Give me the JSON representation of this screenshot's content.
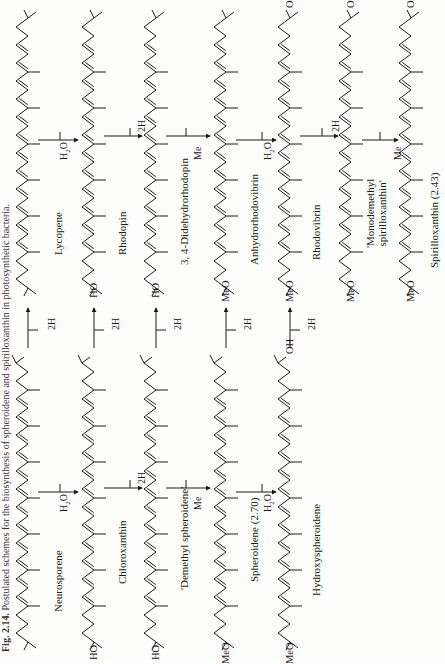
{
  "caption": {
    "figure_number": "Fig. 2.14.",
    "text": "Postulated schemes for the biosynthesis of spheroidene and spirilloxanthin in photosynthetic bacteria."
  },
  "left_column": {
    "title": "Spheroidene pathway",
    "compounds": [
      {
        "name": "Neurosporene",
        "end_group_left": "",
        "end_group_right": ""
      },
      {
        "name": "Chloroxanthin",
        "end_group_left": "HO",
        "end_group_right": ""
      },
      {
        "name": "'Demethyl spheroidene'",
        "end_group_left": "HO",
        "end_group_right": ""
      },
      {
        "name": "Spheroidene (2.70)",
        "end_group_left": "MeO",
        "end_group_right": ""
      },
      {
        "name": "Hydroxyspheroidene",
        "end_group_left": "MeO",
        "end_group_right": "OH"
      }
    ],
    "steps": [
      {
        "reagent": "H2O"
      },
      {
        "reagent": "2H"
      },
      {
        "reagent": "Me"
      },
      {
        "reagent": "H2O"
      }
    ]
  },
  "right_column": {
    "title": "Spirilloxanthin pathway",
    "compounds": [
      {
        "name": "Lycopene",
        "end_group_left": "",
        "end_group_right": ""
      },
      {
        "name": "Rhodopin",
        "end_group_left": "HO",
        "end_group_right": ""
      },
      {
        "name": "3, 4-Didehydrorhodopin",
        "end_group_left": "HO",
        "end_group_right": ""
      },
      {
        "name": "Anhydrorhodovibrin",
        "end_group_left": "MeO",
        "end_group_right": ""
      },
      {
        "name": "Rhodovibrin",
        "end_group_left": "MeO",
        "end_group_right": "OH"
      },
      {
        "name": "'Monodemethyl spirilloxanthin'",
        "end_group_left": "MeO",
        "end_group_right": "OH"
      },
      {
        "name": "Spirilloxanthin (2.43)",
        "end_group_left": "MeO",
        "end_group_right": "OMe"
      }
    ],
    "steps": [
      {
        "reagent": "H2O"
      },
      {
        "reagent": "2H"
      },
      {
        "reagent": "Me"
      },
      {
        "reagent": "H2O"
      },
      {
        "reagent": "2H"
      },
      {
        "reagent": "Me"
      }
    ]
  },
  "cross_steps": [
    {
      "from": "Neurosporene",
      "to": "Lycopene",
      "reagent": "2H"
    },
    {
      "from": "Chloroxanthin",
      "to": "Rhodopin",
      "reagent": "2H"
    },
    {
      "from": "'Demethyl spheroidene'",
      "to": "3, 4-Didehydrorhodopin",
      "reagent": "2H"
    },
    {
      "from": "Spheroidene (2.70)",
      "to": "Anhydrorhodovibrin",
      "reagent": "2H"
    },
    {
      "from": "Hydroxyspheroidene",
      "to": "Rhodovibrin",
      "reagent": "2H"
    }
  ],
  "labels": {
    "l1": "Neurosporene",
    "l2": "Chloroxanthin",
    "l3": "'Demethyl spheroidene'",
    "l4": "Spheroidene (2.70)",
    "l5": "Hydroxyspheroidene",
    "r1": "Lycopene",
    "r2": "Rhodopin",
    "r3": "3, 4-Didehydrorhodopin",
    "r4": "Anhydrorhodovibrin",
    "r5": "Rhodovibrin",
    "r6a": "'Monodemethyl",
    "r6b": "spirilloxanthin'",
    "r7": "Spirilloxanthin (2.43)",
    "ho": "HO",
    "meo": "MeO",
    "oh": "OH",
    "o": "O",
    "h2o_h": "H",
    "h2o_2": "2",
    "h2o_o": "O",
    "twoH": "2H",
    "me": "Me"
  }
}
